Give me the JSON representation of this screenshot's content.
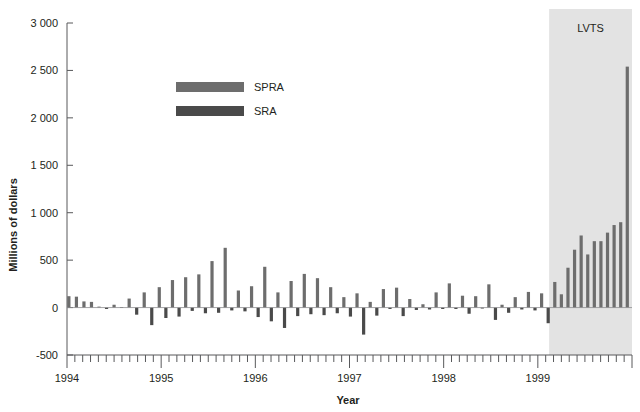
{
  "chart_data": {
    "type": "bar",
    "title": "",
    "subtitle": "",
    "xlabel": "Year",
    "ylabel": "Millions of dollars",
    "ylim": [
      -500,
      3000
    ],
    "yticks": [
      -500,
      0,
      500,
      1000,
      1500,
      2000,
      2500,
      3000
    ],
    "ytick_labels": [
      "-500",
      "0",
      "500",
      "1 000",
      "1 500",
      "2 000",
      "2 500",
      "3 000"
    ],
    "xlim": [
      1994.0,
      2000.0
    ],
    "xticks": [
      1994,
      1995,
      1996,
      1997,
      1998,
      1999
    ],
    "xtick_labels": [
      "1994",
      "1995",
      "1996",
      "1997",
      "1998",
      "1999"
    ],
    "minor_xtick_interval_months": 1,
    "grid": false,
    "legend_position": "upper-center-left",
    "annotations": [
      {
        "text": "LVTS",
        "type": "shaded-region-label",
        "region_start_x": 1999.12,
        "region_end_x": 2000.0,
        "region_color": "#e3e3e3"
      }
    ],
    "series": [
      {
        "name": "SPRA",
        "color": "#6d6d6d",
        "note": "Special Purchase and Resale Agreements (positive bars)"
      },
      {
        "name": "SRA",
        "color": "#4a4a4a",
        "note": "Sale and Repurchase Agreements (negative bars)"
      }
    ],
    "bar_interval_months": 1,
    "values": [
      {
        "x": 1994.02,
        "v": 120
      },
      {
        "x": 1994.1,
        "v": 115
      },
      {
        "x": 1994.18,
        "v": 65
      },
      {
        "x": 1994.26,
        "v": 60
      },
      {
        "x": 1994.34,
        "v": 10
      },
      {
        "x": 1994.42,
        "v": -15
      },
      {
        "x": 1994.5,
        "v": 30
      },
      {
        "x": 1994.58,
        "v": 5
      },
      {
        "x": 1994.66,
        "v": 95
      },
      {
        "x": 1994.74,
        "v": -75
      },
      {
        "x": 1994.82,
        "v": 160
      },
      {
        "x": 1994.9,
        "v": -185
      },
      {
        "x": 1994.98,
        "v": 215
      },
      {
        "x": 1995.05,
        "v": -110
      },
      {
        "x": 1995.12,
        "v": 290
      },
      {
        "x": 1995.19,
        "v": -95
      },
      {
        "x": 1995.26,
        "v": 320
      },
      {
        "x": 1995.33,
        "v": -35
      },
      {
        "x": 1995.4,
        "v": 350
      },
      {
        "x": 1995.47,
        "v": -60
      },
      {
        "x": 1995.54,
        "v": 490
      },
      {
        "x": 1995.61,
        "v": -55
      },
      {
        "x": 1995.68,
        "v": 630
      },
      {
        "x": 1995.75,
        "v": -30
      },
      {
        "x": 1995.82,
        "v": 180
      },
      {
        "x": 1995.89,
        "v": -40
      },
      {
        "x": 1995.96,
        "v": 225
      },
      {
        "x": 1996.03,
        "v": -100
      },
      {
        "x": 1996.1,
        "v": 430
      },
      {
        "x": 1996.17,
        "v": -145
      },
      {
        "x": 1996.24,
        "v": 160
      },
      {
        "x": 1996.31,
        "v": -215
      },
      {
        "x": 1996.38,
        "v": 280
      },
      {
        "x": 1996.45,
        "v": -90
      },
      {
        "x": 1996.52,
        "v": 355
      },
      {
        "x": 1996.59,
        "v": -70
      },
      {
        "x": 1996.66,
        "v": 310
      },
      {
        "x": 1996.73,
        "v": -80
      },
      {
        "x": 1996.8,
        "v": 215
      },
      {
        "x": 1996.87,
        "v": -60
      },
      {
        "x": 1996.94,
        "v": 110
      },
      {
        "x": 1997.01,
        "v": -95
      },
      {
        "x": 1997.08,
        "v": 150
      },
      {
        "x": 1997.15,
        "v": -285
      },
      {
        "x": 1997.22,
        "v": 60
      },
      {
        "x": 1997.29,
        "v": -85
      },
      {
        "x": 1997.36,
        "v": 195
      },
      {
        "x": 1997.43,
        "v": -15
      },
      {
        "x": 1997.5,
        "v": 210
      },
      {
        "x": 1997.57,
        "v": -90
      },
      {
        "x": 1997.64,
        "v": 90
      },
      {
        "x": 1997.71,
        "v": -25
      },
      {
        "x": 1997.78,
        "v": 35
      },
      {
        "x": 1997.85,
        "v": -20
      },
      {
        "x": 1997.92,
        "v": 160
      },
      {
        "x": 1997.99,
        "v": -15
      },
      {
        "x": 1998.06,
        "v": 255
      },
      {
        "x": 1998.13,
        "v": -15
      },
      {
        "x": 1998.2,
        "v": 125
      },
      {
        "x": 1998.27,
        "v": -65
      },
      {
        "x": 1998.34,
        "v": 120
      },
      {
        "x": 1998.41,
        "v": -10
      },
      {
        "x": 1998.48,
        "v": 245
      },
      {
        "x": 1998.55,
        "v": -130
      },
      {
        "x": 1998.62,
        "v": 30
      },
      {
        "x": 1998.69,
        "v": -55
      },
      {
        "x": 1998.76,
        "v": 110
      },
      {
        "x": 1998.83,
        "v": -20
      },
      {
        "x": 1998.9,
        "v": 165
      },
      {
        "x": 1998.97,
        "v": -30
      },
      {
        "x": 1999.04,
        "v": 150
      },
      {
        "x": 1999.11,
        "v": -165
      },
      {
        "x": 1999.18,
        "v": 270
      },
      {
        "x": 1999.25,
        "v": 140
      },
      {
        "x": 1999.32,
        "v": 420
      },
      {
        "x": 1999.39,
        "v": 610
      },
      {
        "x": 1999.46,
        "v": 760
      },
      {
        "x": 1999.53,
        "v": 560
      },
      {
        "x": 1999.6,
        "v": 700
      },
      {
        "x": 1999.67,
        "v": 700
      },
      {
        "x": 1999.74,
        "v": 790
      },
      {
        "x": 1999.81,
        "v": 870
      },
      {
        "x": 1999.88,
        "v": 900
      },
      {
        "x": 1999.95,
        "v": 2540
      }
    ]
  },
  "legend": {
    "items": [
      {
        "label": "SPRA",
        "color": "#6d6d6d"
      },
      {
        "label": "SRA",
        "color": "#4a4a4a"
      }
    ]
  },
  "axes": {
    "y_title": "Millions of dollars",
    "x_title": "Year"
  }
}
